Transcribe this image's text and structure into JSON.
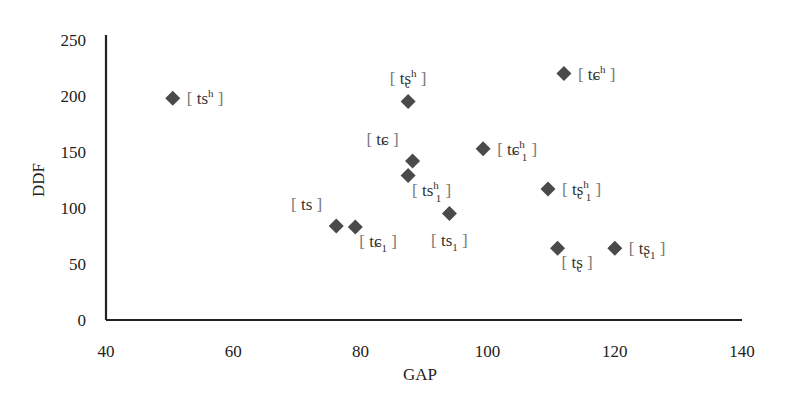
{
  "chart_data": {
    "type": "scatter",
    "title": "",
    "xlabel": "GAP",
    "ylabel": "DDF",
    "xlim": [
      40,
      140
    ],
    "ylim": [
      0,
      250
    ],
    "xticks": [
      40,
      60,
      80,
      100,
      120,
      140
    ],
    "yticks": [
      0,
      50,
      100,
      150,
      200,
      250
    ],
    "xtick_labels": [
      "40",
      "60",
      "80",
      "100",
      "120",
      "140"
    ],
    "ytick_labels": [
      "0",
      "50",
      "100",
      "150",
      "200",
      "250"
    ],
    "grid": false,
    "legend": null,
    "marker": "diamond",
    "marker_color": "#4a4a4a",
    "points": [
      {
        "label": "tsʰ",
        "base": "ts",
        "sup": "h",
        "sub": "",
        "x": 50.5,
        "y": 198,
        "label_pos": "right"
      },
      {
        "label": "tʂʰ",
        "base": "tʂ",
        "sup": "h",
        "sub": "",
        "x": 87.5,
        "y": 195,
        "label_pos": "above"
      },
      {
        "label": "tɕʰ",
        "base": "tɕ",
        "sup": "h",
        "sub": "",
        "x": 112,
        "y": 220,
        "label_pos": "right"
      },
      {
        "label": "tɕ",
        "base": "tɕ",
        "sup": "",
        "sub": "",
        "x": 88.2,
        "y": 142,
        "label_pos": "above-left"
      },
      {
        "label": "tsʰ₁",
        "base": "ts",
        "sup": "h",
        "sub": "1",
        "x": 87.5,
        "y": 129,
        "label_pos": "below-right"
      },
      {
        "label": "tɕʰ₁",
        "base": "tɕ",
        "sup": "h",
        "sub": "1",
        "x": 99.3,
        "y": 153,
        "label_pos": "right"
      },
      {
        "label": "ts",
        "base": "ts",
        "sup": "",
        "sub": "",
        "x": 76.2,
        "y": 84,
        "label_pos": "above-left"
      },
      {
        "label": "tɕ₁",
        "base": "tɕ",
        "sup": "",
        "sub": "1",
        "x": 79.2,
        "y": 83,
        "label_pos": "below-right"
      },
      {
        "label": "ts₁",
        "base": "ts",
        "sup": "",
        "sub": "1",
        "x": 94,
        "y": 95,
        "label_pos": "below"
      },
      {
        "label": "tʂʰ₁",
        "base": "tʂ",
        "sup": "h",
        "sub": "1",
        "x": 109.5,
        "y": 117,
        "label_pos": "right"
      },
      {
        "label": "tʂ",
        "base": "tʂ",
        "sup": "",
        "sub": "",
        "x": 111,
        "y": 64,
        "label_pos": "below-right"
      },
      {
        "label": "tʂ₁",
        "base": "tʂ",
        "sup": "",
        "sub": "1",
        "x": 120,
        "y": 64,
        "label_pos": "right"
      }
    ]
  }
}
